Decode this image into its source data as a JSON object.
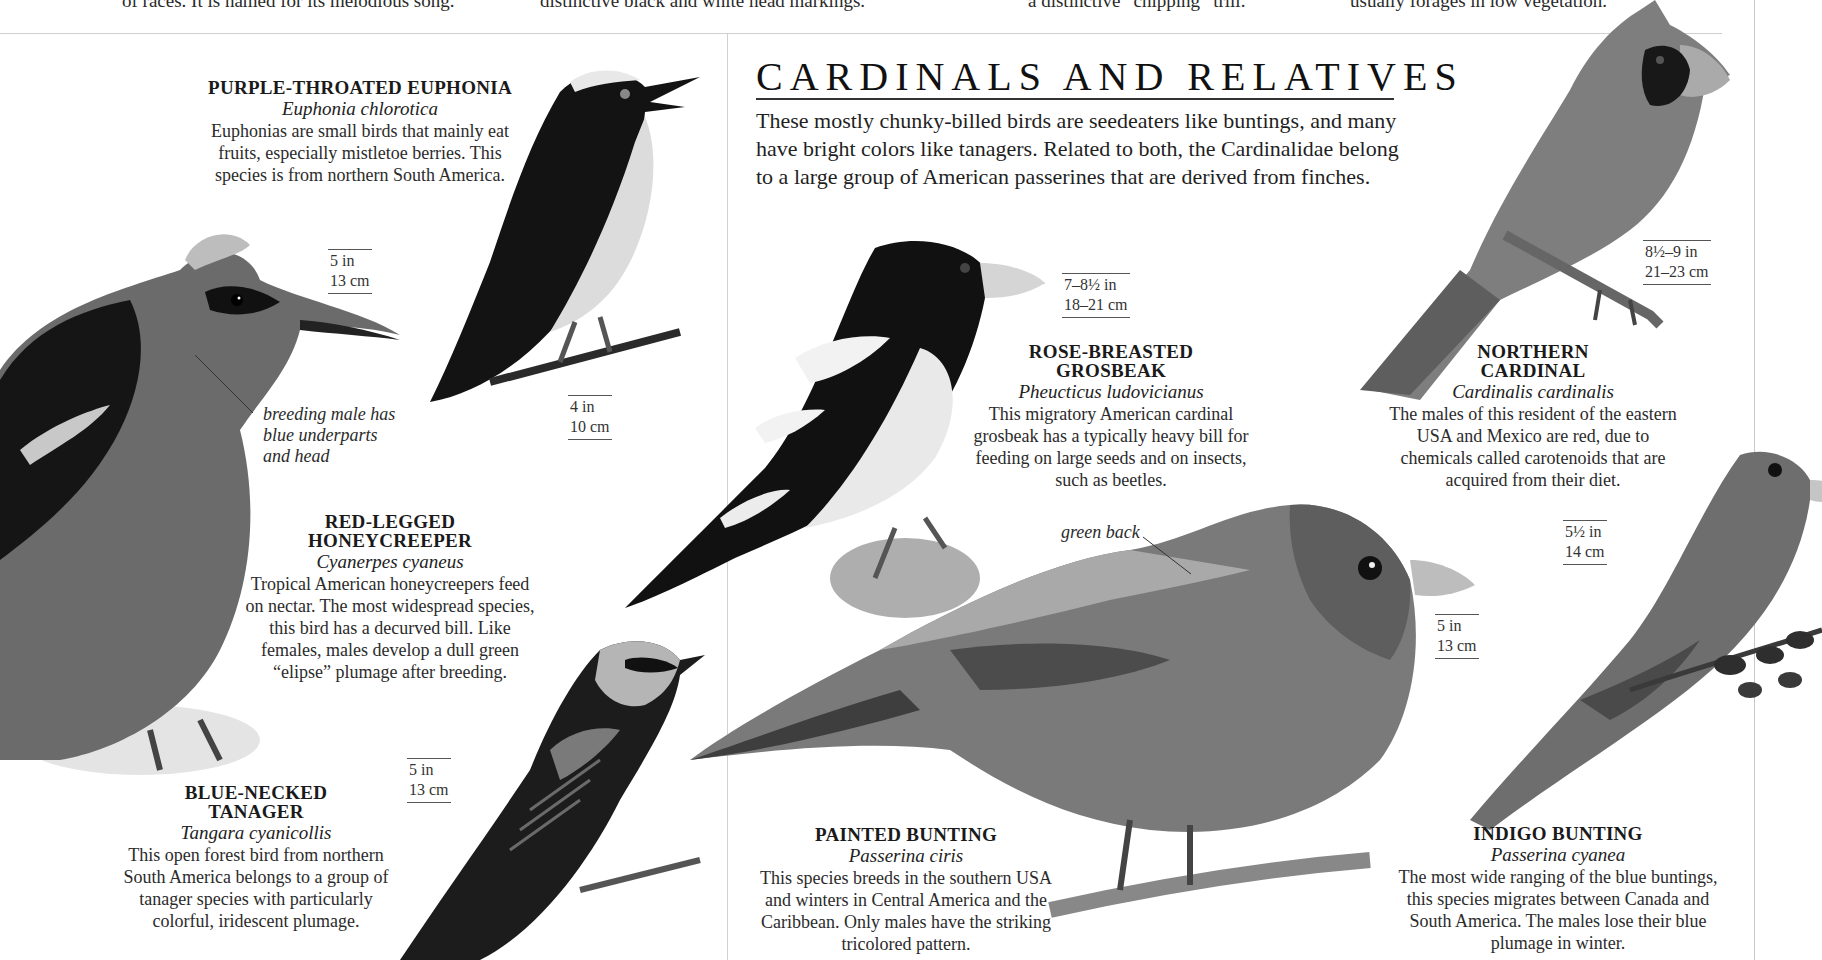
{
  "top_captions": [
    "of races. It is named for its melodious song.",
    "distinctive black and white head markings.",
    "a distinctive “chipping” trill.",
    "usually forages in low vegetation."
  ],
  "section": {
    "title": "CARDINALS AND RELATIVES",
    "intro": "These mostly chunky-billed birds are seedeaters like buntings, and many have bright colors like tanagers. Related to both, the Cardinalidae belong to a large group of American passerines that are derived from finches."
  },
  "species": {
    "euphonia": {
      "name": "PURPLE-THROATED EUPHONIA",
      "scientific": "Euphonia chlorotica",
      "description": "Euphonias are small birds that mainly eat fruits, especially mistletoe berries. This species is from northern South America.",
      "size_in": "4 in",
      "size_cm": "10 cm"
    },
    "honeycreeper": {
      "name_line1": "RED-LEGGED",
      "name_line2": "HONEYCREEPER",
      "scientific": "Cyanerpes cyaneus",
      "description": "Tropical American honeycreepers feed on nectar. The most widespread species, this bird has a decurved bill. Like females, males develop a dull green “elipse” plumage after breeding.",
      "size_in": "5 in",
      "size_cm": "13 cm",
      "annotation": "breeding male has blue underparts and head"
    },
    "tanager": {
      "name_line1": "BLUE-NECKED",
      "name_line2": "TANAGER",
      "scientific": "Tangara cyanicollis",
      "description": "This open forest bird from northern South America belongs to a group of tanager species with particularly colorful, iridescent plumage.",
      "size_in": "5 in",
      "size_cm": "13 cm"
    },
    "grosbeak": {
      "name_line1": "ROSE-BREASTED",
      "name_line2": "GROSBEAK",
      "scientific": "Pheucticus ludovicianus",
      "description": "This migratory American cardinal grosbeak has a typically heavy bill for feeding on large seeds and on insects, such as beetles.",
      "size_in": "7–8½ in",
      "size_cm": "18–21 cm"
    },
    "cardinal": {
      "name_line1": "NORTHERN",
      "name_line2": "CARDINAL",
      "scientific": "Cardinalis cardinalis",
      "description": "The males of this resident of the eastern USA and Mexico are red, due to chemicals called carotenoids that are acquired from their diet.",
      "size_in": "8½–9 in",
      "size_cm": "21–23 cm"
    },
    "painted_bunting": {
      "name": "PAINTED BUNTING",
      "scientific": "Passerina ciris",
      "description": "This species breeds in the southern USA and winters in Central America and the Caribbean. Only males have the striking tricolored pattern.",
      "size_in": "5 in",
      "size_cm": "13 cm",
      "annotation": "green back"
    },
    "indigo_bunting": {
      "name": "INDIGO BUNTING",
      "scientific": "Passerina cyanea",
      "description": "The most wide ranging of the blue buntings, this species migrates between Canada and South America. The males lose their blue plumage in winter.",
      "size_in": "5½ in",
      "size_cm": "14 cm"
    }
  }
}
